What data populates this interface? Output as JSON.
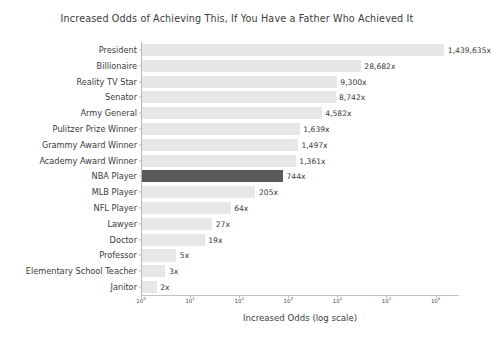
{
  "chart_data": {
    "type": "bar",
    "orientation": "horizontal",
    "title": "Increased Odds of Achieving This, If You Have a Father Who Achieved It",
    "xlabel": "Increased Odds (log scale)",
    "ylabel": "",
    "xscale": "log",
    "grid": false,
    "legend": null,
    "xlim": [
      1,
      3000000
    ],
    "xticks": [
      {
        "value": 1,
        "label": "10",
        "exp": "0"
      },
      {
        "value": 10,
        "label": "10",
        "exp": "1"
      },
      {
        "value": 100,
        "label": "10",
        "exp": "2"
      },
      {
        "value": 1000,
        "label": "10",
        "exp": "3"
      },
      {
        "value": 10000,
        "label": "10",
        "exp": "4"
      },
      {
        "value": 100000,
        "label": "10",
        "exp": "5"
      },
      {
        "value": 1000000,
        "label": "10",
        "exp": "6"
      }
    ],
    "categories": [
      "President",
      "Billionaire",
      "Reality TV Star",
      "Senator",
      "Army General",
      "Pulitzer Prize Winner",
      "Grammy Award Winner",
      "Academy Award Winner",
      "NBA Player",
      "MLB Player",
      "NFL Player",
      "Lawyer",
      "Doctor",
      "Professor",
      "Elementary School Teacher",
      "Janitor"
    ],
    "values": [
      1439635,
      28682,
      9300,
      8742,
      4582,
      1639,
      1497,
      1361,
      744,
      205,
      64,
      27,
      19,
      5,
      3,
      2
    ],
    "value_labels": [
      "1,439,635x",
      "28,682x",
      "9,300x",
      "8,742x",
      "4,582x",
      "1,639x",
      "1,497x",
      "1,361x",
      "744x",
      "205x",
      "64x",
      "27x",
      "19x",
      "5x",
      "3x",
      "2x"
    ],
    "highlighted": [
      "NBA Player"
    ],
    "colors": {
      "bar": "#e7e7e7",
      "bar_highlight": "#5a5a5a",
      "text": "#3b3b3b",
      "axis": "#b8b8b8",
      "background": "#ffffff"
    }
  }
}
